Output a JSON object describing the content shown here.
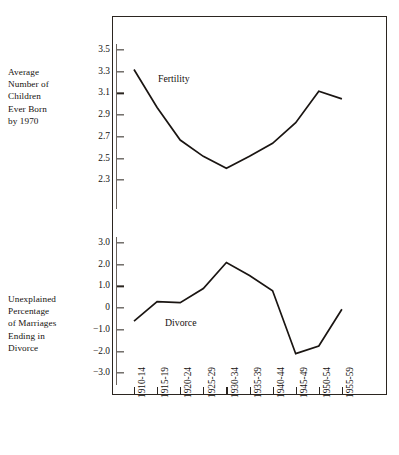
{
  "chart_data": {
    "type": "line",
    "title": "",
    "categories": [
      "1910-14",
      "1915-19",
      "1920-24",
      "1925-29",
      "1930-34",
      "1935-39",
      "1940-44",
      "1945-49",
      "1950-54",
      "1955-59"
    ],
    "xlabel": "",
    "grid": false,
    "legend_position": "inline-annotation",
    "panels": [
      {
        "id": "fertility",
        "ylabel": "Average\nNumber of\nChildren\nEver Born\nby 1970",
        "series_label": "Fertility",
        "yticks": [
          "3.5",
          "3.3",
          "3.1",
          "2.9",
          "2.7",
          "2.5",
          "2.3"
        ],
        "ytick_values": [
          3.5,
          3.3,
          3.1,
          2.9,
          2.7,
          2.5,
          2.3
        ],
        "ylim": [
          2.3,
          3.5
        ],
        "values": [
          3.32,
          2.97,
          2.67,
          2.52,
          2.41,
          2.52,
          2.64,
          2.83,
          3.12,
          3.05
        ]
      },
      {
        "id": "divorce",
        "ylabel": "Unexplained\nPercentage\nof Marriages\nEnding in\nDivorce",
        "series_label": "Divorce",
        "yticks": [
          "3.0",
          "2.0",
          "1.0",
          "0",
          "−1.0",
          "−2.0",
          "−3.0"
        ],
        "ytick_values": [
          3.0,
          2.0,
          1.0,
          0,
          -1.0,
          -2.0,
          -3.0
        ],
        "ylim": [
          -3.0,
          3.0
        ],
        "values": [
          -0.6,
          0.3,
          0.25,
          0.9,
          2.1,
          1.5,
          0.8,
          -2.1,
          -1.75,
          -0.05
        ]
      }
    ]
  },
  "colors": {
    "line": "#1a1512",
    "frame": "#2b2520",
    "axis": "#6a625c",
    "text": "#16120f",
    "background": "#ffffff"
  }
}
